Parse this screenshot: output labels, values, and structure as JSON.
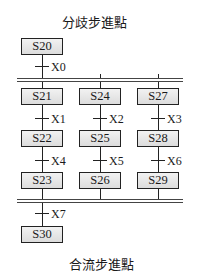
{
  "diagram": {
    "title_top": "分歧步進點",
    "title_bottom": "合流步進點",
    "initial_step": "S20",
    "initial_transition": "X0",
    "branches": [
      {
        "steps": [
          "S21",
          "S22",
          "S23"
        ],
        "transitions": [
          "X1",
          "X4"
        ]
      },
      {
        "steps": [
          "S24",
          "S25",
          "S26"
        ],
        "transitions": [
          "X2",
          "X5"
        ]
      },
      {
        "steps": [
          "S27",
          "S28",
          "S29"
        ],
        "transitions": [
          "X3",
          "X6"
        ]
      }
    ],
    "merge_transition": "X7",
    "final_step": "S30"
  }
}
